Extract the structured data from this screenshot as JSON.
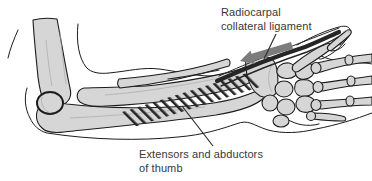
{
  "figure": {
    "type": "anatomical line drawing",
    "labels": {
      "radiocarpal": {
        "line1": "Radiocarpal",
        "line2": "collateral ligament"
      },
      "extensors": {
        "line1": "Extensors and abductors",
        "line2": "of thumb"
      }
    },
    "icons": {
      "arrow": "thick-gray-arrow-pointing-lower-left"
    },
    "colors": {
      "background": "#ffffff",
      "bone_fill": "#d6d6d6",
      "outline": "#1c1c1c",
      "arrow": "#7c7c7c",
      "label_text": "#383838",
      "ligament": "#262626"
    }
  }
}
